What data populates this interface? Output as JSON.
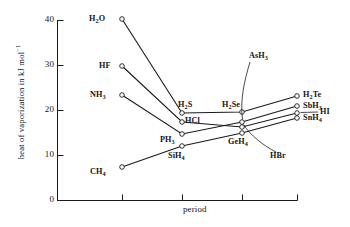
{
  "chart_data": {
    "type": "line",
    "title": "",
    "xlabel": "period",
    "ylabel": "heat of vaporization in kJ mol",
    "ylabel_exponent": "−1",
    "ylim": [
      0,
      42
    ],
    "yticks": [
      0,
      10,
      20,
      30,
      40
    ],
    "ytick_labels": [
      "0",
      "10",
      "20",
      "30",
      "40"
    ],
    "xticks": [
      1,
      2,
      3,
      4
    ],
    "xtick_labels": [
      "",
      "",
      "",
      ""
    ],
    "grid": false,
    "legend": "none",
    "markers": "open-circle",
    "x": [
      1,
      2,
      3,
      4
    ],
    "series": [
      {
        "name": "group-16-hydrides",
        "point_labels": [
          "H2O",
          "H2S",
          "H2Se",
          "H2Te"
        ],
        "values": [
          40.6,
          18.8,
          19.5,
          23.2
        ]
      },
      {
        "name": "group-17-hydrides",
        "point_labels": [
          "HF",
          "HCl",
          "HBr",
          "HI"
        ],
        "values": [
          29.8,
          16.9,
          16.2,
          19.3
        ]
      },
      {
        "name": "group-15-hydrides",
        "point_labels": [
          "NH3",
          "PH3",
          "AsH3",
          "SbH3"
        ],
        "values": [
          23.3,
          14.6,
          17.4,
          20.8
        ]
      },
      {
        "name": "group-14-hydrides",
        "point_labels": [
          "CH4",
          "SiH4",
          "GeH4",
          "SnH4"
        ],
        "values": [
          7.4,
          12.1,
          15.0,
          18.4
        ]
      }
    ]
  },
  "annotations": {
    "h2o": {
      "html": "H<sub>2</sub>O"
    },
    "hf": {
      "html": "HF"
    },
    "nh3": {
      "html": "NH<sub>3</sub>"
    },
    "ch4": {
      "html": "CH<sub>4</sub>"
    },
    "h2s": {
      "html": "H<sub>2</sub>S"
    },
    "hcl": {
      "html": "HCl"
    },
    "ph3": {
      "html": "PH<sub>3</sub>"
    },
    "sih4": {
      "html": "SiH<sub>4</sub>"
    },
    "h2se": {
      "html": "H<sub>2</sub>Se"
    },
    "ash3": {
      "html": "AsH<sub>3</sub>"
    },
    "hbr": {
      "html": "HBr"
    },
    "geh4": {
      "html": "GeH<sub>4</sub>"
    },
    "h2te": {
      "html": "H<sub>2</sub>Te"
    },
    "sbh3": {
      "html": "SbH<sub>3</sub>"
    },
    "hi": {
      "html": "HI"
    },
    "snh4": {
      "html": "SnH<sub>4</sub>"
    }
  },
  "axis": {
    "y_title_text": "heat of vaporization in kJ mol",
    "y_title_sup": "−1",
    "x_title_text": "period",
    "tick_40": "40",
    "tick_30": "30",
    "tick_20": "20",
    "tick_10": "10",
    "tick_0": "0"
  },
  "colors": {
    "axis": "#1a1a1a",
    "line": "#1a1a1a",
    "marker_fill": "#ffffff",
    "background": "#ffffff",
    "text": "#141414"
  }
}
